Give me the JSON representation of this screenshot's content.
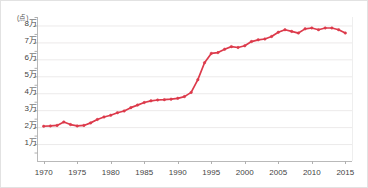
{
  "chart_data": {
    "type": "line",
    "title": "",
    "subtitle": "",
    "xlabel": "",
    "ylabel": "",
    "unit_label": "(点)",
    "ylim": [
      0,
      85000
    ],
    "ytick_values": [
      10000,
      20000,
      30000,
      40000,
      50000,
      60000,
      70000,
      80000
    ],
    "ytick_labels": [
      "1万",
      "2万",
      "3万",
      "4万",
      "5万",
      "6万",
      "7万",
      "8万"
    ],
    "xlim": [
      1969,
      2016
    ],
    "xtick_labels": [
      "1970",
      "1975",
      "1980",
      "1985",
      "1990",
      "1995",
      "2000",
      "2005",
      "2010",
      "2015"
    ],
    "xtick_values": [
      1970,
      1975,
      1980,
      1985,
      1990,
      1995,
      2000,
      2005,
      2010,
      2015
    ],
    "grid": "horizontal",
    "legend": "none",
    "series": [
      {
        "name": "点数",
        "color": "#dc3a4b",
        "marker": "circle",
        "x": [
          1970,
          1971,
          1972,
          1973,
          1974,
          1975,
          1976,
          1977,
          1978,
          1979,
          1980,
          1981,
          1982,
          1983,
          1984,
          1985,
          1986,
          1987,
          1988,
          1989,
          1990,
          1991,
          1992,
          1993,
          1994,
          1995,
          1996,
          1997,
          1998,
          1999,
          2000,
          2001,
          2002,
          2003,
          2004,
          2005,
          2006,
          2007,
          2008,
          2009,
          2010,
          2011,
          2012,
          2013,
          2014,
          2015
        ],
        "values": [
          20500,
          20700,
          21000,
          23000,
          21500,
          20700,
          21000,
          22500,
          24500,
          26000,
          27000,
          28500,
          29500,
          31500,
          33000,
          34500,
          35500,
          36000,
          36200,
          36500,
          37000,
          38000,
          40500,
          48000,
          58000,
          63500,
          64000,
          66000,
          67500,
          67000,
          68000,
          70500,
          71500,
          72000,
          73500,
          76000,
          77500,
          76500,
          75500,
          78000,
          78500,
          77500,
          78500,
          78500,
          77500,
          75500
        ]
      }
    ]
  },
  "axis": {
    "y_axis_name": "y-axis",
    "x_axis_name": "x-axis"
  }
}
